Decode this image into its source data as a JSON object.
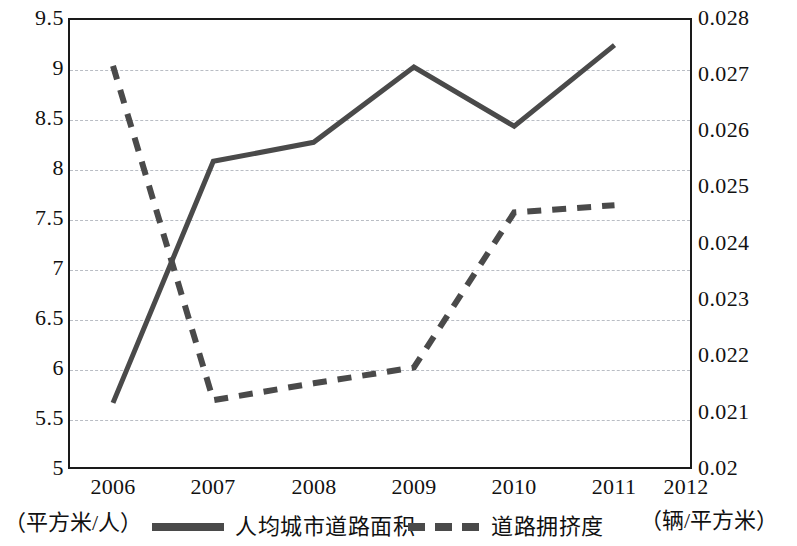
{
  "chart_data": {
    "type": "line",
    "title": "",
    "xlabel": "",
    "categories": [
      "2006",
      "2007",
      "2008",
      "2009",
      "2010",
      "2011",
      "2012"
    ],
    "grid": true,
    "legend_position": "bottom",
    "axes": {
      "left": {
        "unit_label": "（平方米/人）",
        "ylim": [
          5,
          9.5
        ],
        "tick_step": 0.5,
        "ticks": [
          "9.5",
          "9",
          "8.5",
          "8",
          "7.5",
          "7",
          "6.5",
          "6",
          "5.5",
          "5"
        ],
        "tick_values": [
          9.5,
          9,
          8.5,
          8,
          7.5,
          7,
          6.5,
          6,
          5.5,
          5
        ]
      },
      "right": {
        "unit_label": "（辆/平方米）",
        "ylim": [
          0.02,
          0.028
        ],
        "tick_step": 0.001,
        "ticks": [
          "0.028",
          "0.027",
          "0.026",
          "0.025",
          "0.024",
          "0.023",
          "0.022",
          "0.021",
          "0.02"
        ],
        "tick_values": [
          0.028,
          0.027,
          0.026,
          0.025,
          0.024,
          0.023,
          0.022,
          0.021,
          0.02
        ]
      }
    },
    "series": [
      {
        "name": "人均城市道路面积",
        "axis": "left",
        "style": "solid",
        "color": "#4a4a4a",
        "x": [
          "2006",
          "2007",
          "2008",
          "2009",
          "2010",
          "2011"
        ],
        "values": [
          5.66,
          8.07,
          8.26,
          9.01,
          8.42,
          9.23
        ]
      },
      {
        "name": "道路拥挤度",
        "axis": "right",
        "style": "dashed",
        "color": "#4a4a4a",
        "x": [
          "2006",
          "2007",
          "2008",
          "2009",
          "2010",
          "2011"
        ],
        "values": [
          0.02715,
          0.02122,
          0.02152,
          0.0218,
          0.02455,
          0.02468
        ]
      }
    ]
  },
  "legend": {
    "items": [
      {
        "label": "人均城市道路面积",
        "style": "solid"
      },
      {
        "label": "道路拥挤度",
        "style": "dashed"
      }
    ]
  },
  "colors": {
    "line": "#4a4a4a",
    "frame": "#1a1a1a",
    "grid": "#b9bdc4",
    "text": "#111111",
    "background": "#ffffff"
  }
}
